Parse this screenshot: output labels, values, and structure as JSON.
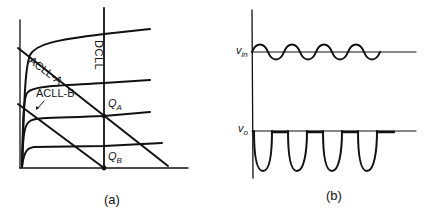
{
  "panel_a": {
    "caption": "(a)",
    "labels": {
      "dcll": "DCLL",
      "acll_a": "ACLL-A",
      "acll_b": "ACLL-B",
      "q_a_main": "Q",
      "q_a_sub": "A",
      "q_b_main": "Q",
      "q_b_sub": "B"
    },
    "description": "Transistor output characteristic curves with DC load line and two AC load lines; Q-point A on DCLL mid-region, Q-point B at cutoff on x-axis"
  },
  "panel_b": {
    "caption": "(b)",
    "labels": {
      "vin_main": "v",
      "vin_sub": "in",
      "vo_main": "v",
      "vo_sub": "o"
    },
    "description": "Small sinusoidal input v_in and half-wave clipped (negative-going) output v_o, four cycles"
  },
  "colors": {
    "ink": "#111111",
    "background": "#ffffff"
  }
}
